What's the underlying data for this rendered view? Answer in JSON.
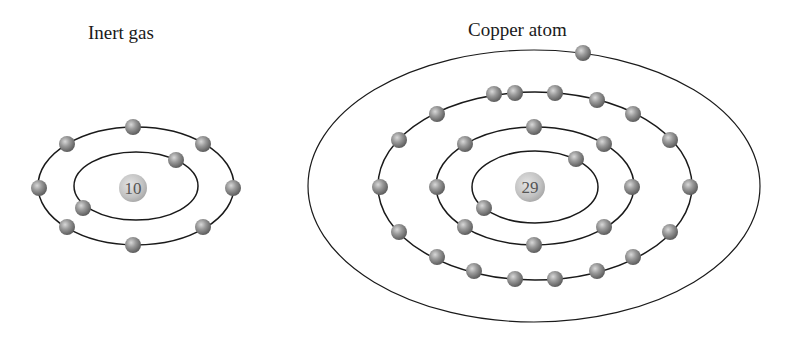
{
  "diagram": {
    "type": "bohr-model-comparison",
    "colors": {
      "orbit": "#1a1a1a",
      "electron": "#8a8a8a",
      "nucleus": "#c4c4c4",
      "background": "#ffffff"
    },
    "atoms": [
      {
        "title": "Inert gas",
        "nucleus_label": "10",
        "shells": [
          {
            "electrons": 2
          },
          {
            "electrons": 8
          }
        ]
      },
      {
        "title": "Copper atom",
        "nucleus_label": "29",
        "shells": [
          {
            "electrons": 2
          },
          {
            "electrons": 8
          },
          {
            "electrons": 18
          },
          {
            "electrons": 1
          }
        ]
      }
    ]
  }
}
